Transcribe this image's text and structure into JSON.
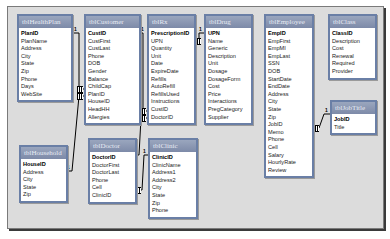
{
  "diagram": {
    "type": "relationships",
    "tables": [
      {
        "name": "tblHealthPlan",
        "primary_key": "PlanID",
        "fields": [
          "PlanID",
          "PlanName",
          "Address",
          "City",
          "State",
          "Zip",
          "Phone",
          "Days",
          "WebSite"
        ]
      },
      {
        "name": "tblCustomer",
        "primary_key": "CustID",
        "fields": [
          "CustID",
          "CustFirst",
          "CustLast",
          "Phone",
          "DOB",
          "Gender",
          "Balance",
          "ChildCap",
          "PlanID",
          "HouseID",
          "HeadHH",
          "Allergies"
        ]
      },
      {
        "name": "tblRx",
        "primary_key": "PrescriptionID",
        "fields": [
          "PrescriptionID",
          "UPN",
          "Quantity",
          "Unit",
          "Date",
          "ExpireDate",
          "Refills",
          "AutoRefill",
          "RefillsUsed",
          "Instructions",
          "CustID",
          "DoctorID"
        ]
      },
      {
        "name": "tblDrug",
        "primary_key": "UPN",
        "fields": [
          "UPN",
          "Name",
          "Generic",
          "Description",
          "Unit",
          "Dosage",
          "DosageForm",
          "Cost",
          "Price",
          "Interactions",
          "PregCategory",
          "Supplier"
        ]
      },
      {
        "name": "tblEmployee",
        "primary_key": "EmpID",
        "fields": [
          "EmpID",
          "EmpFirst",
          "EmpMI",
          "EmpLast",
          "SSN",
          "DOB",
          "StartDate",
          "EndDate",
          "Address",
          "City",
          "State",
          "Zip",
          "JobID",
          "Memo",
          "Phone",
          "Cell",
          "Salary",
          "HourlyRate",
          "Review"
        ]
      },
      {
        "name": "tblClass",
        "primary_key": "ClassID",
        "fields": [
          "ClassID",
          "Description",
          "Cost",
          "Renewal",
          "Required",
          "Provider"
        ]
      },
      {
        "name": "tblJobTitle",
        "primary_key": "JobID",
        "fields": [
          "JobID",
          "Title"
        ]
      },
      {
        "name": "tblHousehold",
        "primary_key": "HouseID",
        "fields": [
          "HouseID",
          "Address",
          "City",
          "State",
          "Zip"
        ]
      },
      {
        "name": "tblDoctor",
        "primary_key": "DoctorID",
        "fields": [
          "DoctorID",
          "DoctorFirst",
          "DoctorLast",
          "Phone",
          "Cell",
          "ClinicID"
        ]
      },
      {
        "name": "tblClinic",
        "primary_key": "ClinicID",
        "fields": [
          "ClinicID",
          "ClinicName",
          "Address1",
          "Address2",
          "City",
          "State",
          "Zip",
          "Phone"
        ]
      }
    ],
    "relationships": [
      {
        "from": "tblHealthPlan.PlanID",
        "to": "tblCustomer.PlanID",
        "one": "1",
        "many": "∞"
      },
      {
        "from": "tblHousehold.HouseID",
        "to": "tblCustomer.HouseID",
        "one": "1",
        "many": "∞"
      },
      {
        "from": "tblCustomer.CustID",
        "to": "tblRx.CustID",
        "one": "1",
        "many": "∞"
      },
      {
        "from": "tblDrug.UPN",
        "to": "tblRx.UPN",
        "one": "1",
        "many": "∞"
      },
      {
        "from": "tblDoctor.DoctorID",
        "to": "tblRx.DoctorID",
        "one": "1",
        "many": "∞"
      },
      {
        "from": "tblClinic.ClinicID",
        "to": "tblDoctor.ClinicID",
        "one": "1",
        "many": "∞"
      },
      {
        "from": "tblJobTitle.JobID",
        "to": "tblEmployee.JobID",
        "one": "1",
        "many": "∞"
      }
    ],
    "colors": {
      "title_bar": "#8794b0",
      "border": "#6a7fa6",
      "canvas": "#dcdcdc"
    }
  }
}
